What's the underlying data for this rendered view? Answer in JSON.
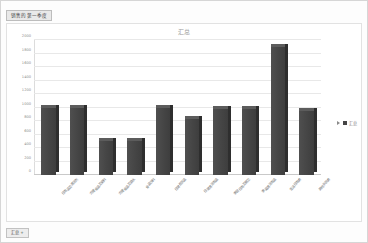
{
  "window": {
    "name_box_label": "销售的第一季度",
    "sheet_tab_label": "汇总 +"
  },
  "legend": {
    "series_label": "汇总",
    "swatch_color": "#454545"
  },
  "chart_data": {
    "type": "bar",
    "title": "汇总",
    "xlabel": "",
    "ylabel": "",
    "ylim": [
      0,
      2000
    ],
    "grid": true,
    "legend_position": "right",
    "yticks": [
      0,
      200,
      400,
      600,
      800,
      1000,
      1200,
      1400,
      1600,
      1800,
      2000
    ],
    "ytick_labels": [
      "0",
      "200",
      "400",
      "600",
      "800",
      "1000",
      "1200",
      "1400",
      "1600",
      "1800",
      "2000"
    ],
    "categories": [
      "日用品及清洁剂",
      "方便食品及调料",
      "方便食品及酒水",
      "食品饮料",
      "日常百货品",
      "日常清洁用品",
      "家居日用及厨卫",
      "家庭清洁用品",
      "生活日用类",
      "其他杂货类"
    ],
    "series": [
      {
        "name": "汇总",
        "values": [
          1000,
          1000,
          500,
          500,
          1000,
          830,
          980,
          980,
          1900,
          950
        ]
      }
    ]
  }
}
